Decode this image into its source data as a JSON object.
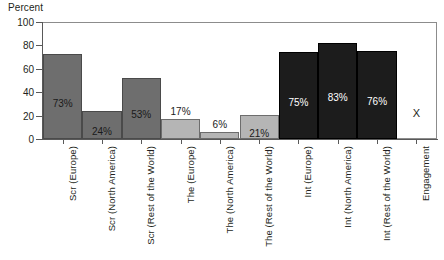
{
  "chart_data": {
    "type": "bar",
    "title": "",
    "ylabel": "Percent",
    "xlabel": "",
    "ylim": [
      0,
      100
    ],
    "yticks": [
      0,
      20,
      40,
      60,
      80,
      100
    ],
    "grid": false,
    "legend": "none",
    "categories": [
      "Scr (Europe)",
      "Scr (North America)",
      "Scr (Rest of the World)",
      "The (Europe)",
      "The (North America)",
      "The (Rest of the World)",
      "Int (Europe)",
      "Int (North America)",
      "Int (Rest of the World)",
      "Engagement"
    ],
    "values": [
      73,
      24,
      53,
      17,
      6,
      21,
      75,
      83,
      76,
      null
    ],
    "data_labels": [
      "73%",
      "24%",
      "53%",
      "17%",
      "6%",
      "21%",
      "75%",
      "83%",
      "76%",
      "X"
    ],
    "groups": [
      "Scr",
      "Scr",
      "Scr",
      "The",
      "The",
      "The",
      "Int",
      "Int",
      "Int",
      "Engagement"
    ],
    "missing_marker": "X",
    "missing_category": "Engagement",
    "colors": {
      "scr": "#6e6e6e",
      "the": "#b5b5b5",
      "int": "#1c1c1c",
      "axis": "#595959",
      "frame": "#8c8c8c",
      "text": "#231f20",
      "label_on_dark": "#ffffff"
    }
  }
}
